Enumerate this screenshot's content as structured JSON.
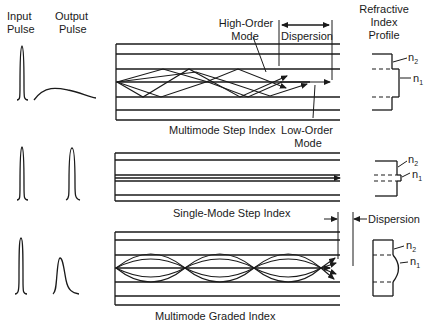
{
  "headers": {
    "input_pulse": [
      "Input",
      "Pulse"
    ],
    "output_pulse": [
      "Output",
      "Pulse"
    ],
    "refractive_index_profile": [
      "Refractive",
      "Index",
      "Profile"
    ]
  },
  "panels": [
    {
      "id": "multimode-step-index",
      "caption": "Multimode Step Index",
      "annotations": {
        "high_order_mode": [
          "High-Order",
          "Mode"
        ],
        "low_order_mode": [
          "Low-Order",
          "Mode"
        ],
        "dispersion": "Dispersion"
      },
      "profile": {
        "n2": "n",
        "n2_sub": "2",
        "n1": "n",
        "n1_sub": "1"
      }
    },
    {
      "id": "single-mode-step-index",
      "caption": "Single-Mode Step Index",
      "profile": {
        "n2": "n",
        "n2_sub": "2",
        "n1": "n",
        "n1_sub": "1"
      }
    },
    {
      "id": "multimode-graded-index",
      "caption": "Multimode Graded Index",
      "annotations": {
        "dispersion": "Dispersion"
      },
      "profile": {
        "n2": "n",
        "n2_sub": "2",
        "n1": "n",
        "n1_sub": "1"
      }
    }
  ],
  "colors": {
    "ink": "#1a1a1a",
    "background": "#ffffff"
  }
}
